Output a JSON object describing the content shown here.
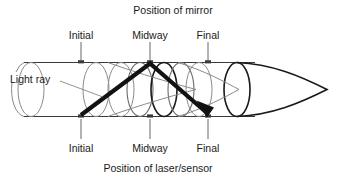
{
  "figure": {
    "title_top": "Position of mirror",
    "title_bottom": "Position of laser/sensor",
    "ray_label": "Light ray",
    "top_positions": [
      {
        "label": "Initial",
        "x": 81
      },
      {
        "label": "Midway",
        "x": 150
      },
      {
        "label": "Final",
        "x": 208
      }
    ],
    "bottom_positions": [
      {
        "label": "Initial",
        "x": 81
      },
      {
        "label": "Midway",
        "x": 150
      },
      {
        "label": "Final",
        "x": 208
      }
    ],
    "colors": {
      "ink": "#1a1a1a",
      "ray": "#121212",
      "outline": "#3a3a3a",
      "faint": "#8a8a8a",
      "background": "#ffffff"
    }
  }
}
